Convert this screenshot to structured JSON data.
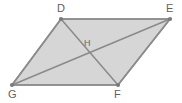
{
  "figure": {
    "type": "geometry-diagram",
    "shape_name": "parallelogram",
    "background_color": "#ffffff",
    "fill_color": "#d6d6d6",
    "stroke_color": "#8c8c8c",
    "diagonal_stroke_color": "#8a8a8a",
    "vertex_dot_color": "#7a7a7a",
    "label_color": "#5f5f5f",
    "vertices": [
      {
        "id": "D",
        "label": "D",
        "x": 61,
        "y": 19,
        "label_x": 57,
        "label_y": 3
      },
      {
        "id": "E",
        "label": "E",
        "x": 170,
        "y": 19,
        "label_x": 166,
        "label_y": 3
      },
      {
        "id": "F",
        "label": "F",
        "x": 118,
        "y": 85,
        "label_x": 114,
        "label_y": 89
      },
      {
        "id": "G",
        "label": "G",
        "x": 12,
        "y": 85,
        "label_x": 8,
        "label_y": 89
      }
    ],
    "interior_points": [
      {
        "id": "H",
        "label": "H",
        "x": 88,
        "y": 52,
        "label_x": 84,
        "label_y": 39
      }
    ],
    "sides": [
      {
        "name": "DE",
        "from": "D",
        "to": "E"
      },
      {
        "name": "EF",
        "from": "E",
        "to": "F"
      },
      {
        "name": "FG",
        "from": "F",
        "to": "G"
      },
      {
        "name": "GD",
        "from": "G",
        "to": "D"
      }
    ],
    "diagonals": [
      {
        "name": "DF",
        "from": "D",
        "to": "F"
      },
      {
        "name": "GE",
        "from": "G",
        "to": "E"
      }
    ],
    "polygon_points": "61,19 170,19 118,85 12,85"
  }
}
